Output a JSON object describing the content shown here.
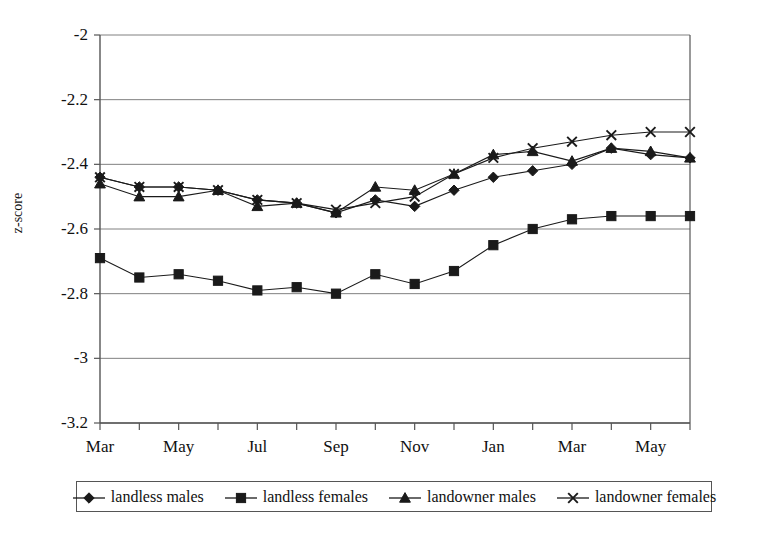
{
  "chart_data": {
    "type": "line",
    "title": "",
    "xlabel": "",
    "ylabel": "z-score",
    "ylim": [
      -3.2,
      -2.0
    ],
    "yticks": [
      -2,
      -2.2,
      -2.4,
      -2.6,
      -2.8,
      -3,
      -3.2
    ],
    "ytick_labels": [
      "-2",
      "-2.2",
      "-2.4",
      "-2.6",
      "-2.8",
      "-3",
      "-3.2"
    ],
    "grid": true,
    "legend_position": "bottom",
    "x": [
      "Mar",
      "Apr",
      "May",
      "Jun",
      "Jul",
      "Aug",
      "Sep",
      "Oct",
      "Nov",
      "Dec",
      "Jan",
      "Feb",
      "Mar",
      "Apr",
      "May",
      "Jun"
    ],
    "xtick_labels": [
      "Mar",
      "May",
      "Jul",
      "Sep",
      "Nov",
      "Jan",
      "Mar",
      "May"
    ],
    "xtick_indices": [
      0,
      2,
      4,
      6,
      8,
      10,
      12,
      14
    ],
    "series": [
      {
        "name": "landless males",
        "marker": "diamond",
        "values": [
          -2.44,
          -2.47,
          -2.47,
          -2.48,
          -2.51,
          -2.52,
          -2.55,
          -2.51,
          -2.53,
          -2.48,
          -2.44,
          -2.42,
          -2.4,
          -2.35,
          -2.37,
          -2.38
        ]
      },
      {
        "name": "landless females",
        "marker": "square",
        "values": [
          -2.69,
          -2.75,
          -2.74,
          -2.76,
          -2.79,
          -2.78,
          -2.8,
          -2.74,
          -2.77,
          -2.73,
          -2.65,
          -2.6,
          -2.57,
          -2.56,
          -2.56,
          -2.56
        ]
      },
      {
        "name": "landowner males",
        "marker": "triangle",
        "values": [
          -2.46,
          -2.5,
          -2.5,
          -2.48,
          -2.53,
          -2.52,
          -2.55,
          -2.47,
          -2.48,
          -2.43,
          -2.37,
          -2.36,
          -2.39,
          -2.35,
          -2.36,
          -2.38
        ]
      },
      {
        "name": "landowner females",
        "marker": "cross",
        "values": [
          -2.44,
          -2.47,
          -2.47,
          -2.48,
          -2.51,
          -2.52,
          -2.54,
          -2.52,
          -2.5,
          -2.43,
          -2.38,
          -2.35,
          -2.33,
          -2.31,
          -2.3,
          -2.3
        ]
      }
    ]
  },
  "axis": {
    "y_title": "z-score"
  },
  "legend": {
    "items": [
      {
        "label": "landless males",
        "marker": "diamond-marker-icon"
      },
      {
        "label": "landless females",
        "marker": "square-marker-icon"
      },
      {
        "label": "landowner males",
        "marker": "triangle-marker-icon"
      },
      {
        "label": "landowner females",
        "marker": "cross-marker-icon"
      }
    ]
  },
  "style": {
    "line_color": "#1a1a1a",
    "grid_color": "#808080",
    "axis_color": "#555555",
    "background": "#ffffff"
  }
}
